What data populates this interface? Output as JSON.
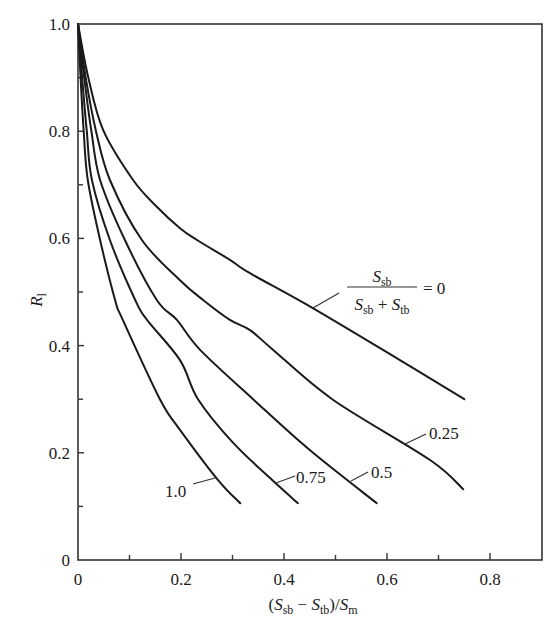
{
  "chart_data": {
    "type": "line",
    "title": "",
    "xlabel": "(S_sb − S_tb)/S_m",
    "ylabel": "R_l",
    "xlim": [
      0,
      0.9
    ],
    "ylim": [
      0,
      1.0
    ],
    "x_ticks": [
      "0",
      "0.2",
      "0.4",
      "0.6",
      "0.8"
    ],
    "x_minor_ticks": [
      0.1,
      0.3,
      0.5,
      0.7
    ],
    "y_ticks": [
      "0",
      "0.2",
      "0.4",
      "0.6",
      "0.8",
      "1.0"
    ],
    "y_minor_ticks": [
      0.1,
      0.3,
      0.5,
      0.7,
      0.9
    ],
    "grid": false,
    "legend": {
      "type": "inline-curve-labels",
      "parameter": "S_sb/(S_sb + S_tb)",
      "parameter_numerator": "S_sb",
      "parameter_denominator": "S_sb + S_tb"
    },
    "series": [
      {
        "name": "0",
        "label": "= 0",
        "points": [
          [
            0,
            1.0
          ],
          [
            0.02,
            0.9
          ],
          [
            0.049,
            0.802
          ],
          [
            0.107,
            0.709
          ],
          [
            0.153,
            0.659
          ],
          [
            0.198,
            0.619
          ],
          [
            0.231,
            0.597
          ],
          [
            0.295,
            0.56
          ],
          [
            0.334,
            0.535
          ],
          [
            0.456,
            0.47
          ],
          [
            0.625,
            0.373
          ],
          [
            0.75,
            0.3
          ]
        ]
      },
      {
        "name": "0.25",
        "label": "0.25",
        "points": [
          [
            0,
            1.0
          ],
          [
            0.015,
            0.9
          ],
          [
            0.035,
            0.8
          ],
          [
            0.062,
            0.709
          ],
          [
            0.124,
            0.597
          ],
          [
            0.198,
            0.522
          ],
          [
            0.243,
            0.485
          ],
          [
            0.295,
            0.448
          ],
          [
            0.334,
            0.429
          ],
          [
            0.379,
            0.392
          ],
          [
            0.495,
            0.299
          ],
          [
            0.683,
            0.187
          ],
          [
            0.748,
            0.132
          ]
        ]
      },
      {
        "name": "0.5",
        "label": "0.5",
        "points": [
          [
            0,
            1.0
          ],
          [
            0.012,
            0.9
          ],
          [
            0.026,
            0.8
          ],
          [
            0.043,
            0.709
          ],
          [
            0.091,
            0.597
          ],
          [
            0.153,
            0.485
          ],
          [
            0.192,
            0.448
          ],
          [
            0.237,
            0.392
          ],
          [
            0.34,
            0.3
          ],
          [
            0.45,
            0.205
          ],
          [
            0.58,
            0.106
          ]
        ]
      },
      {
        "name": "0.75",
        "label": "0.75",
        "points": [
          [
            0,
            1.0
          ],
          [
            0.008,
            0.9
          ],
          [
            0.017,
            0.8
          ],
          [
            0.027,
            0.709
          ],
          [
            0.062,
            0.597
          ],
          [
            0.111,
            0.485
          ],
          [
            0.134,
            0.448
          ],
          [
            0.198,
            0.373
          ],
          [
            0.233,
            0.3
          ],
          [
            0.3,
            0.22
          ],
          [
            0.377,
            0.149
          ],
          [
            0.427,
            0.106
          ]
        ]
      },
      {
        "name": "1.0",
        "label": "1.0",
        "points": [
          [
            0,
            1.0
          ],
          [
            0.005,
            0.9
          ],
          [
            0.011,
            0.8
          ],
          [
            0.019,
            0.709
          ],
          [
            0.043,
            0.597
          ],
          [
            0.072,
            0.485
          ],
          [
            0.087,
            0.448
          ],
          [
            0.159,
            0.3
          ],
          [
            0.198,
            0.243
          ],
          [
            0.272,
            0.149
          ],
          [
            0.315,
            0.106
          ]
        ]
      }
    ]
  },
  "labels": {
    "y_axis_R": "R",
    "y_axis_sub": "l",
    "x_axis_open": "(",
    "x_axis_S1": "S",
    "x_axis_sub1": "sb",
    "x_axis_minus": " − ",
    "x_axis_S2": "S",
    "x_axis_sub2": "tb",
    "x_axis_close": ")/",
    "x_axis_S3": "S",
    "x_axis_sub3": "m",
    "legend_num_S": "S",
    "legend_num_sub": "sb",
    "legend_den_S1": "S",
    "legend_den_sub1": "sb",
    "legend_den_plus": " + ",
    "legend_den_S2": "S",
    "legend_den_sub2": "tb",
    "legend_equals": "= 0",
    "curve_025": "0.25",
    "curve_05": "0.5",
    "curve_075": "0.75",
    "curve_10": "1.0"
  }
}
